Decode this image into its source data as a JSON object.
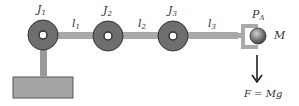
{
  "diagram": {
    "joints": [
      {
        "label": "J",
        "sub": "1"
      },
      {
        "label": "J",
        "sub": "2"
      },
      {
        "label": "J",
        "sub": "3"
      }
    ],
    "links": [
      {
        "label": "l",
        "sub": "1"
      },
      {
        "label": "l",
        "sub": "2"
      },
      {
        "label": "l",
        "sub": "3"
      }
    ],
    "end_point": {
      "label": "P",
      "sub": "A"
    },
    "mass": {
      "label": "M"
    },
    "force": {
      "label": "F = Mg"
    },
    "colors": {
      "joint_fill": "#6e6e6e",
      "joint_stroke": "#333333",
      "link_fill": "#a9a9a9",
      "base_fill": "#a5a5a5",
      "base_stroke": "#555555",
      "mass_fill": "#7a7a7a",
      "arrow": "#111111"
    }
  }
}
